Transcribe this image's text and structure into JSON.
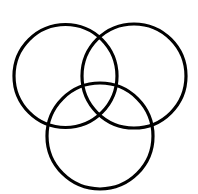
{
  "diagram": {
    "type": "venn",
    "canvas": {
      "width": 198,
      "height": 194,
      "background": "#ffffff"
    },
    "stroke_color": "#000000",
    "stroke_width": 3.2,
    "sets": [
      {
        "id": "left",
        "label": "",
        "cx": 65.5,
        "cy": 76,
        "r": 51.5
      },
      {
        "id": "right",
        "label": "",
        "cx": 134,
        "cy": 76,
        "r": 52
      },
      {
        "id": "bottom",
        "label": "",
        "cx": 100,
        "cy": 136,
        "r": 53
      }
    ]
  }
}
